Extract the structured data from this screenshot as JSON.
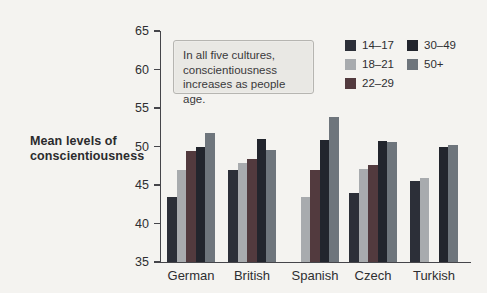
{
  "figure": {
    "y_axis_title": "Mean levels of\nconscientiousness",
    "note_text": "In all five cultures,\nconscientiousness\nincreases as people age."
  },
  "chart_data": {
    "type": "bar",
    "title": "",
    "xlabel": "",
    "ylabel": "Mean levels of conscientiousness",
    "ylim": [
      35,
      65
    ],
    "yticks": [
      65,
      60,
      55,
      50,
      45,
      40,
      35
    ],
    "grid": false,
    "legend_position": "top-right",
    "annotation": "In all five cultures, conscientiousness increases as people age.",
    "categories": [
      "German",
      "British",
      "Spanish",
      "Czech",
      "Turkish"
    ],
    "series": [
      {
        "name": "14–17",
        "color": "#2c2f38",
        "values": [
          43.5,
          47.0,
          null,
          44.0,
          45.5
        ]
      },
      {
        "name": "18–21",
        "color": "#a8abae",
        "values": [
          47.0,
          47.8,
          43.5,
          47.1,
          45.9
        ]
      },
      {
        "name": "22–29",
        "color": "#523a3e",
        "values": [
          49.4,
          48.4,
          47.0,
          47.6,
          null
        ]
      },
      {
        "name": "30–49",
        "color": "#22252d",
        "values": [
          50.0,
          51.0,
          50.9,
          50.7,
          50.0
        ]
      },
      {
        "name": "50+",
        "color": "#6e757c",
        "values": [
          51.7,
          49.6,
          53.8,
          50.6,
          50.2
        ]
      }
    ]
  }
}
